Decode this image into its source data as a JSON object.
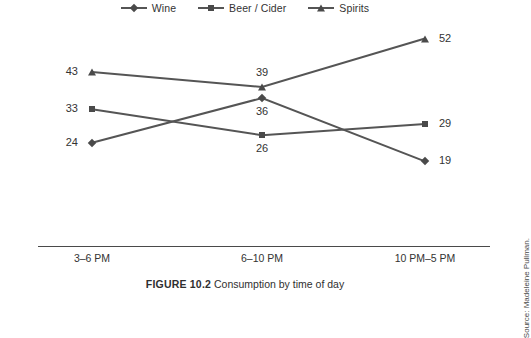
{
  "legend": {
    "items": [
      {
        "label": "Wine",
        "marker": "diamond-marker-icon"
      },
      {
        "label": "Beer / Cider",
        "marker": "square-marker-icon"
      },
      {
        "label": "Spirits",
        "marker": "triangle-marker-icon"
      }
    ]
  },
  "caption": {
    "figure_number": "FIGURE 10.2",
    "text": "Consumption by time of day"
  },
  "source": {
    "text": "Source: Madeleine Pullman."
  },
  "colors": {
    "line": "#555555",
    "marker": "#4a4a4a",
    "axis": "#4a4a4a",
    "text": "#333333"
  },
  "chart_data": {
    "type": "line",
    "title": "",
    "xlabel": "",
    "ylabel": "",
    "categories": [
      "3–6 PM",
      "6–10 PM",
      "10 PM–5 PM"
    ],
    "series": [
      {
        "name": "Wine",
        "marker": "diamond",
        "values": [
          24,
          36,
          19
        ]
      },
      {
        "name": "Beer / Cider",
        "marker": "square",
        "values": [
          33,
          26,
          29
        ]
      },
      {
        "name": "Spirits",
        "marker": "triangle",
        "values": [
          43,
          39,
          52
        ]
      }
    ],
    "ylim": [
      0,
      60
    ],
    "grid": false,
    "legend_position": "top-center",
    "data_labels": true
  }
}
